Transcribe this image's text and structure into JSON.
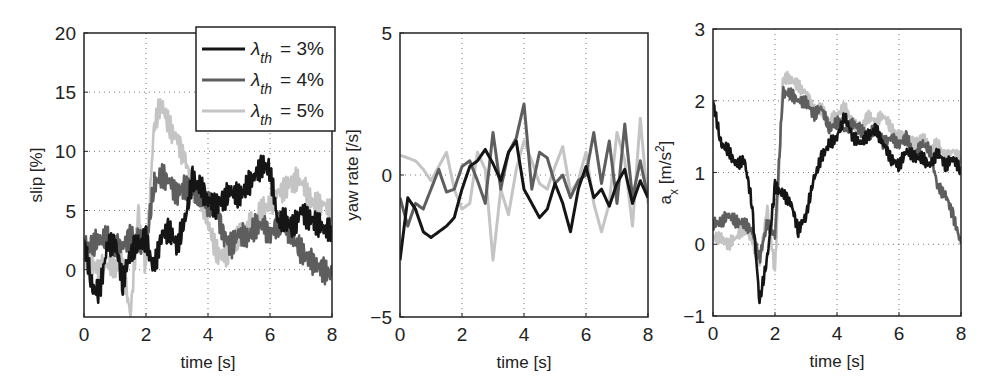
{
  "colors": {
    "s3": "#151515",
    "s4": "#5e5e5e",
    "s5": "#c4c4c4",
    "axis": "#222222",
    "grid": "#777777"
  },
  "legend": {
    "entries": [
      {
        "symbol": "λ",
        "sub": "th",
        "text": "= 3%",
        "color": "#151515"
      },
      {
        "symbol": "λ",
        "sub": "th",
        "text": "= 4%",
        "color": "#5e5e5e"
      },
      {
        "symbol": "λ",
        "sub": "th",
        "text": "= 5%",
        "color": "#c4c4c4"
      }
    ]
  },
  "chart_data": [
    {
      "type": "line",
      "title": "",
      "xlabel": "time [s]",
      "ylabel": "slip [%]",
      "xlim": [
        0,
        8
      ],
      "ylim": [
        -4,
        20
      ],
      "xticks": [
        0,
        2,
        4,
        6,
        8
      ],
      "yticks": [
        0,
        5,
        10,
        15,
        20
      ],
      "grid": true,
      "legend_position": "upper right",
      "box": {
        "x": 84,
        "y": 33,
        "w": 248,
        "h": 284
      },
      "x": [
        0,
        0.25,
        0.5,
        0.75,
        1,
        1.25,
        1.5,
        1.75,
        2,
        2.25,
        2.5,
        2.75,
        3,
        3.25,
        3.5,
        3.75,
        4,
        4.25,
        4.5,
        4.75,
        5,
        5.25,
        5.5,
        5.75,
        6,
        6.25,
        6.5,
        6.75,
        7,
        7.25,
        7.5,
        7.75,
        8
      ],
      "series": [
        {
          "name": "λth = 3%",
          "values": [
            2.5,
            -1.5,
            -2,
            2,
            2.5,
            -1,
            1.5,
            2,
            2.5,
            0,
            3,
            3.5,
            2,
            4,
            7.5,
            7,
            6,
            5.5,
            6,
            6.5,
            6,
            7,
            8,
            9,
            8.5,
            4,
            4,
            3.5,
            5,
            4.5,
            4,
            3.5,
            3
          ]
        },
        {
          "name": "λth = 4%",
          "values": [
            2,
            2,
            2.5,
            2.5,
            2,
            2,
            3,
            2.5,
            2,
            7,
            8,
            7.5,
            6.5,
            7,
            6.5,
            6,
            5.5,
            5.5,
            3,
            2,
            3,
            2.5,
            3.5,
            4,
            3,
            4,
            3.5,
            2.5,
            1.5,
            1,
            0.5,
            0,
            -0.5
          ]
        },
        {
          "name": "λth = 5%",
          "values": [
            1,
            0.5,
            0,
            0.5,
            0,
            0.5,
            -4,
            5,
            0,
            12,
            14,
            12,
            11,
            9.5,
            7,
            6,
            4,
            1.5,
            1,
            2,
            3,
            3.5,
            4,
            5,
            5.5,
            6.5,
            7,
            7.5,
            7.5,
            6,
            5.5,
            5.5,
            5
          ]
        }
      ]
    },
    {
      "type": "line",
      "title": "",
      "xlabel": "time [s]",
      "ylabel": "yaw rate [/s]",
      "xlim": [
        0,
        8
      ],
      "ylim": [
        -5,
        5
      ],
      "xticks": [
        0,
        2,
        4,
        6,
        8
      ],
      "yticks": [
        -5,
        0,
        5
      ],
      "grid": true,
      "box": {
        "x": 400,
        "y": 33,
        "w": 248,
        "h": 284
      },
      "x": [
        0,
        0.25,
        0.5,
        0.75,
        1,
        1.25,
        1.5,
        1.75,
        2,
        2.25,
        2.5,
        2.75,
        3,
        3.25,
        3.5,
        3.75,
        4,
        4.25,
        4.5,
        4.75,
        5,
        5.25,
        5.5,
        5.75,
        6,
        6.25,
        6.5,
        6.75,
        7,
        7.25,
        7.5,
        7.75,
        8
      ],
      "series": [
        {
          "name": "λth = 3%",
          "values": [
            -3,
            -0.8,
            -1.2,
            -2,
            -2.2,
            -2,
            -1.8,
            -1.5,
            -0.5,
            0.3,
            0.5,
            0.9,
            0.4,
            -0.2,
            0.8,
            1.2,
            -0.5,
            -1,
            -1.5,
            -1.2,
            -0.3,
            -1,
            -2,
            -0.5,
            0.3,
            -0.8,
            -0.5,
            -1.1,
            -0.3,
            0.2,
            -1,
            -0.2,
            -0.8
          ]
        },
        {
          "name": "λth = 4%",
          "values": [
            -0.8,
            -1.8,
            -1,
            -1.2,
            -0.5,
            0.2,
            -0.6,
            -0.5,
            0.3,
            0.5,
            -0.2,
            -1,
            1.5,
            -0.5,
            0.8,
            1.3,
            2.5,
            -0.5,
            0.8,
            0.6,
            -0.3,
            0,
            -0.8,
            -0.2,
            0,
            1.5,
            -0.3,
            1.2,
            -1,
            1.8,
            -0.8,
            0.5,
            -0.8
          ]
        },
        {
          "name": "λth = 5%",
          "values": [
            0.7,
            0.6,
            0.5,
            0.2,
            -0.2,
            0.3,
            0.8,
            -0.5,
            -1.2,
            -1,
            0.8,
            0.2,
            -3,
            -0.5,
            -1.4,
            0.2,
            1.2,
            0.5,
            -0.3,
            -0.5,
            0.3,
            1,
            -0.6,
            -0.2,
            0.8,
            -1,
            -2,
            -1,
            1.5,
            0.5,
            -1.8,
            2,
            -1
          ]
        }
      ]
    },
    {
      "type": "line",
      "title": "",
      "xlabel": "time [s]",
      "ylabel": "a_x [m/s^2]",
      "xlim": [
        0,
        8
      ],
      "ylim": [
        -1,
        3
      ],
      "xticks": [
        0,
        2,
        4,
        6,
        8
      ],
      "yticks": [
        -1,
        0,
        1,
        2,
        3
      ],
      "grid": true,
      "box": {
        "x": 713,
        "y": 29,
        "w": 248,
        "h": 287
      },
      "x": [
        0,
        0.25,
        0.5,
        0.75,
        1,
        1.25,
        1.5,
        1.75,
        2,
        2.25,
        2.5,
        2.75,
        3,
        3.25,
        3.5,
        3.75,
        4,
        4.25,
        4.5,
        4.75,
        5,
        5.25,
        5.5,
        5.75,
        6,
        6.25,
        6.5,
        6.75,
        7,
        7.25,
        7.5,
        7.75,
        8
      ],
      "series": [
        {
          "name": "λth = 3%",
          "values": [
            2,
            1.4,
            1.3,
            1.1,
            1.2,
            0.6,
            -0.8,
            -0.2,
            0.8,
            0.7,
            0.6,
            0.2,
            0.4,
            0.9,
            1.2,
            1.4,
            1.5,
            1.8,
            1.5,
            1.4,
            1.5,
            1.6,
            1.4,
            1.2,
            1.1,
            1.3,
            1.2,
            1.2,
            1.1,
            1.3,
            1.1,
            1.2,
            1
          ]
        },
        {
          "name": "λth = 4%",
          "values": [
            0.3,
            0.3,
            0.4,
            0.3,
            0.3,
            0.2,
            -0.2,
            0.3,
            0.1,
            2.1,
            2.1,
            2,
            2,
            1.8,
            1.9,
            1.6,
            1.7,
            1.6,
            1.7,
            1.6,
            1.5,
            1.6,
            1.4,
            1.5,
            1.4,
            1.5,
            1.2,
            1.4,
            1.3,
            0.8,
            0.7,
            0.4,
            0
          ]
        },
        {
          "name": "λth = 5%",
          "values": [
            0.1,
            0.1,
            0,
            0.1,
            0.2,
            0.1,
            -0.3,
            0.5,
            -0.4,
            2.3,
            2.3,
            2.2,
            2.1,
            1.9,
            1.9,
            1.7,
            1.8,
            1.9,
            1.7,
            1.6,
            1.8,
            1.7,
            1.8,
            1.6,
            1.5,
            1.5,
            1.4,
            1.5,
            1.3,
            1.4,
            1.2,
            1.3,
            1.2
          ]
        }
      ]
    }
  ]
}
